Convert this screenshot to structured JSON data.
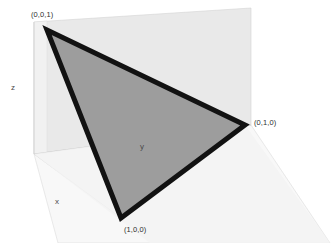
{
  "figure": {
    "background_color": "#ffffff"
  },
  "vertices": [
    {
      "id": "v001",
      "label": "(0,0,1)",
      "screen_x": 47,
      "screen_y": 30
    },
    {
      "id": "v010",
      "label": "(0,1,0)",
      "screen_x": 245,
      "screen_y": 125
    },
    {
      "id": "v100",
      "label": "(1,0,0)",
      "screen_x": 121,
      "screen_y": 218
    }
  ],
  "axes": [
    {
      "id": "z",
      "label": "z",
      "screen_x": 14,
      "screen_y": 88
    },
    {
      "id": "y",
      "label": "y",
      "screen_x": 143,
      "screen_y": 147
    },
    {
      "id": "x",
      "label": "x",
      "screen_x": 58,
      "screen_y": 202
    }
  ],
  "colors": {
    "triangle_fill": "#9b9b9b",
    "triangle_outline": "#111111",
    "back_plane": "#e8e8e8",
    "left_plane": "#f2f2f2",
    "floor_plane": "#f7f7f7",
    "plane_edge": "#cfcfcf",
    "axis_text": "#4a4a4a",
    "vertex_text": "#2e2e2e",
    "background": "#ffffff"
  },
  "geometry": {
    "origin_corner": {
      "x": 34,
      "y": 154
    },
    "back_plane_points": "34,22 251,8 251,125 34,154",
    "floor_plane_points": "34,154 251,125 330,243 58,243",
    "triangle_points": "47,30 245,125 121,218",
    "y_axis_line": {
      "x1": 34,
      "y1": 154,
      "x2": 245,
      "y2": 125
    },
    "x_axis_line": {
      "x1": 34,
      "y1": 154,
      "x2": 121,
      "y2": 218
    },
    "z_axis_line": {
      "x1": 34,
      "y1": 154,
      "x2": 34,
      "y2": 22
    },
    "triangle_stroke_width": 5
  }
}
